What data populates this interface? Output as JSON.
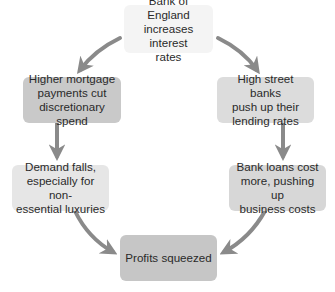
{
  "diagram": {
    "type": "cycle-flow",
    "arrow_color": "#8a8a8a",
    "nodes": [
      {
        "id": "boe",
        "label": "Bank of England\nincreases interest\nrates",
        "fill": "#f4f4f4"
      },
      {
        "id": "mortgage",
        "label": "Higher mortgage\npayments cut\ndiscretionary spend",
        "fill": "#c9c9c9"
      },
      {
        "id": "banks",
        "label": "High street banks\npush up their\nlending rates",
        "fill": "#dcdcdc"
      },
      {
        "id": "demand",
        "label": "Demand falls,\nespecially for non-\nessential luxuries",
        "fill": "#e6e6e6"
      },
      {
        "id": "loans",
        "label": "Bank loans cost\nmore, pushing up\nbusiness costs",
        "fill": "#d7d7d7"
      },
      {
        "id": "profits",
        "label": "Profits squeezed",
        "fill": "#c6c6c6"
      }
    ],
    "edges": [
      {
        "from": "boe",
        "to": "mortgage"
      },
      {
        "from": "boe",
        "to": "banks"
      },
      {
        "from": "mortgage",
        "to": "demand"
      },
      {
        "from": "banks",
        "to": "loans"
      },
      {
        "from": "demand",
        "to": "profits"
      },
      {
        "from": "loans",
        "to": "profits"
      }
    ]
  }
}
